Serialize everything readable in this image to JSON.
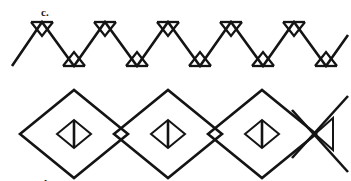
{
  "figure": {
    "background_color": "#ffffff",
    "ink_color": "#141414",
    "width": 351,
    "height": 181
  },
  "panels": [
    {
      "id": "c",
      "label": "c.",
      "label_x": 41,
      "label_y": 7,
      "description": "Continuous zigzag band with small triangles at each apex and trough",
      "motif": "zigzag-with-apex-triangles",
      "geometry": {
        "baseline_top_y": 22,
        "baseline_bottom_y": 66,
        "start_x": 12,
        "end_x": 348,
        "period": 63,
        "peak_triangle_depth": 11,
        "peak_triangle_half_width": 11,
        "trough_triangle_height": 11,
        "trough_triangle_half_width": 11,
        "peak_count": 5,
        "trough_count": 6
      },
      "peaks_x": [
        42,
        105,
        168,
        231,
        294
      ],
      "troughs_x": [
        11,
        74,
        137,
        200,
        263,
        326
      ]
    },
    {
      "id": "d",
      "label": "d.",
      "label_x": 41,
      "label_y": 90,
      "description": "Band of overlapping large diamonds, each containing a small diamond with a central vertical bar; the rightmost unit is truncated to a left-pointing triangle",
      "motif": "overlapping-diamonds-with-inner-diamond",
      "geometry": {
        "center_y": 134,
        "diamond_half_width": 54,
        "diamond_half_height": 44,
        "inner_half_width": 17,
        "inner_half_height": 14,
        "diamond_centers_x": [
          74,
          168,
          262
        ],
        "overlap_x": 46,
        "truncated_triangle": {
          "apex_x": 292,
          "tip_x": 345,
          "half_height": 19
        }
      },
      "diamond_count": 3,
      "inner_bar": "vertical"
    }
  ]
}
